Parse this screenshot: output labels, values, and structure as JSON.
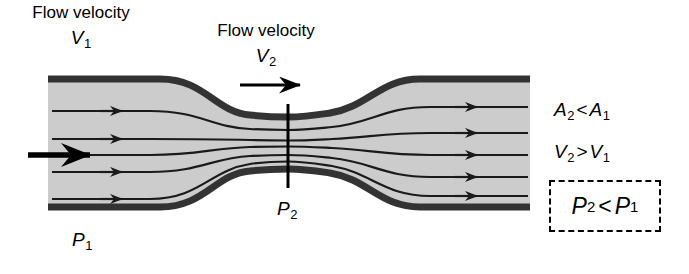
{
  "figure": {
    "background_color": "#ffffff"
  },
  "annotations": {
    "inlet": {
      "caption": "Flow velocity",
      "symbol": "V",
      "subscript": "1"
    },
    "throat": {
      "caption": "Flow velocity",
      "symbol": "V",
      "subscript": "2"
    },
    "pressure_inlet": {
      "symbol": "P",
      "subscript": "1"
    },
    "pressure_throat": {
      "symbol": "P",
      "subscript": "2"
    }
  },
  "relations": [
    {
      "name": "area-relation",
      "left_symbol": "A",
      "left_sub": "2",
      "operator": "<",
      "right_symbol": "A",
      "right_sub": "1"
    },
    {
      "name": "velocity-relation",
      "left_symbol": "V",
      "left_sub": "2",
      "operator": ">",
      "right_symbol": "V",
      "right_sub": "1"
    },
    {
      "name": "pressure-relation",
      "left_symbol": "P",
      "left_sub": "2",
      "operator": "<",
      "right_symbol": "P",
      "right_sub": "1",
      "boxed": true,
      "box_style": "dashed"
    }
  ],
  "colors": {
    "pipe_wall": "#333333",
    "pipe_fill": "#cccccc",
    "streamline": "#1a1a1a",
    "text": "#000000",
    "box_border": "#000000"
  },
  "geometry": {
    "pipe_left": 48,
    "pipe_right": 530,
    "inlet_top": 76,
    "inlet_bottom": 210,
    "throat_x": 288,
    "throat_top": 112,
    "throat_bottom": 180,
    "streamline_count": 5,
    "wall_thickness": 7
  }
}
